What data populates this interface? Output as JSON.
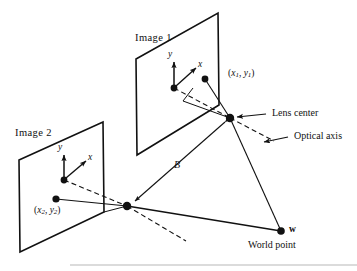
{
  "figure": {
    "kind": "stereo-imaging-geometry-diagram",
    "background_color": "#ffffff",
    "stroke_color": "#111111",
    "rule_color": "#b8b8b8"
  },
  "planes": {
    "image1": {
      "label": "Image 1",
      "origin_label": "origin-dot",
      "axis_y": "y",
      "axis_x": "x",
      "point_label": "(x1, y1)"
    },
    "image2": {
      "label": "Image 2",
      "axis_y": "y",
      "axis_x": "x",
      "point_label": "(x2, y2)"
    }
  },
  "callouts": {
    "lens_center": "Lens center",
    "optical_axis": "Optical axis",
    "baseline": "B",
    "world_point_symbol": "w",
    "world_point": "World point"
  },
  "point_parts": {
    "x1": "x",
    "x1_sub": "1",
    "y1": "y",
    "y1_sub": "1",
    "x2": "x",
    "x2_sub": "2",
    "y2": "y",
    "y2_sub": "2",
    "comma": ", ",
    "open_paren": "(",
    "close_paren": ")"
  }
}
